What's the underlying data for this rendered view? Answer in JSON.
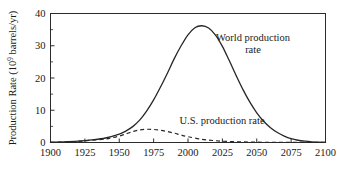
{
  "figure": {
    "background_color": "#ffffff",
    "line_color": "#262626"
  },
  "axes": {
    "y_title_main": "Production Rate (10",
    "y_title_sup": "9",
    "y_title_tail": " barrels/yr)",
    "x_title": ""
  },
  "chart_data": {
    "type": "line",
    "title": "",
    "xlabel": "",
    "ylabel": "Production Rate (10^9 barrels/yr)",
    "xlim": [
      1900,
      2100
    ],
    "ylim": [
      0,
      40
    ],
    "xticks": [
      1900,
      1925,
      1950,
      1975,
      2000,
      2025,
      2050,
      2075,
      2100
    ],
    "xticklabels": [
      "1900",
      "1925",
      "1950",
      "1975",
      "2000",
      "2025",
      "2050",
      "2075",
      "2100"
    ],
    "yticks": [
      0,
      10,
      20,
      30,
      40
    ],
    "yticklabels": [
      "0",
      "10",
      "20",
      "30",
      "40"
    ],
    "y_minor_ticks": [
      5,
      15,
      25,
      35
    ],
    "grid": false,
    "legend_position": "inline-annotations",
    "series": [
      {
        "name": "World production rate",
        "style": "solid",
        "annotation": [
          "World production",
          "rate"
        ],
        "annotation_x": 2035,
        "annotation_y": 30,
        "x": [
          1900,
          1910,
          1920,
          1930,
          1940,
          1950,
          1955,
          1960,
          1965,
          1970,
          1975,
          1980,
          1985,
          1990,
          1995,
          2000,
          2005,
          2010,
          2015,
          2020,
          2025,
          2030,
          2035,
          2040,
          2045,
          2050,
          2055,
          2060,
          2065,
          2070,
          2075,
          2080,
          2085,
          2090,
          2095,
          2100
        ],
        "y": [
          0.1,
          0.2,
          0.4,
          0.8,
          1.4,
          2.6,
          3.6,
          5.0,
          7.0,
          9.8,
          13.2,
          17.2,
          21.5,
          26.0,
          30.0,
          33.4,
          35.6,
          36.2,
          35.5,
          33.3,
          29.8,
          25.4,
          20.8,
          16.4,
          12.5,
          9.2,
          6.6,
          4.6,
          3.1,
          2.0,
          1.2,
          0.7,
          0.4,
          0.2,
          0.1,
          0.05
        ]
      },
      {
        "name": "U.S. production rate",
        "style": "dashed",
        "annotation": [
          "U.S. production rate"
        ],
        "annotation_x": 1988,
        "annotation_y": 6.2,
        "x": [
          1900,
          1910,
          1920,
          1930,
          1940,
          1945,
          1950,
          1955,
          1960,
          1965,
          1970,
          1975,
          1980,
          1985,
          1990,
          1995,
          2000,
          2010,
          2020,
          2030,
          2040,
          2050,
          2060,
          2070,
          2080,
          2090,
          2100
        ],
        "y": [
          0.05,
          0.15,
          0.35,
          0.7,
          1.1,
          1.5,
          2.0,
          2.7,
          3.4,
          3.9,
          4.1,
          4.05,
          3.8,
          3.4,
          2.9,
          2.3,
          1.8,
          1.0,
          0.55,
          0.3,
          0.18,
          0.1,
          0.06,
          0.04,
          0.03,
          0.02,
          0.02
        ]
      }
    ]
  }
}
